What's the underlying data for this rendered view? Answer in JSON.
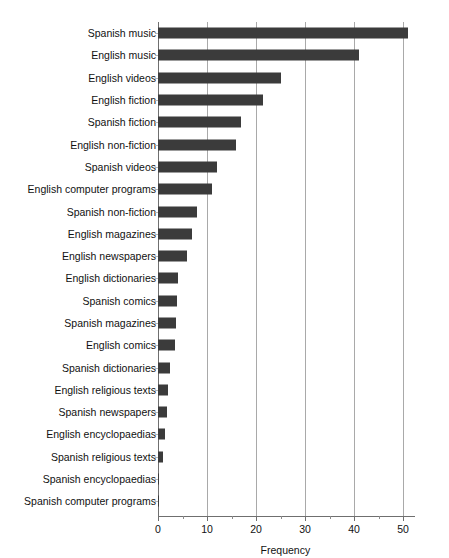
{
  "top_partial_text": "",
  "chart_data": {
    "type": "bar",
    "orientation": "horizontal",
    "title": "",
    "xlabel": "Frequency",
    "ylabel": "",
    "xlim": [
      0,
      52
    ],
    "grid": true,
    "legend": "none",
    "xticks": [
      0,
      10,
      20,
      30,
      40,
      50
    ],
    "xtick_labels": [
      "0",
      "10",
      "20",
      "30",
      "40",
      "50"
    ],
    "xminor_ticks": [
      5,
      15,
      25,
      35,
      45
    ],
    "bar_color": "#3b3b3b",
    "gridline_color": "#a9a9a9",
    "axis_color": "#6f6f6f",
    "categories": [
      "Spanish music",
      "English music",
      "English videos",
      "English fiction",
      "Spanish fiction",
      "English non-fiction",
      "Spanish videos",
      "English computer programs",
      "Spanish non-fiction",
      "English magazines",
      "English newspapers",
      "English dictionaries",
      "Spanish comics",
      "Spanish magazines",
      "English comics",
      "Spanish dictionaries",
      "English religious texts",
      "Spanish newspapers",
      "English encyclopaedias",
      "Spanish religious texts",
      "Spanish encyclopaedias",
      "Spanish computer programs"
    ],
    "values": [
      51,
      41,
      25,
      21.5,
      17,
      16,
      12,
      11,
      8,
      7,
      6,
      4,
      3.8,
      3.7,
      3.5,
      2.5,
      2,
      1.9,
      1.5,
      1,
      0.3,
      0.25
    ]
  }
}
